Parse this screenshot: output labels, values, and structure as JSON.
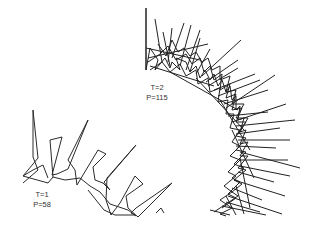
{
  "figure": {
    "panels": [
      {
        "id": "t1",
        "label_line1": "T=1",
        "label_line2": "P=58",
        "description": "sparse polyline arc with outward spikes"
      },
      {
        "id": "t2",
        "label_line1": "T=2",
        "label_line2": "P=115",
        "description": "dense polyline arc with many outward spikes"
      }
    ],
    "stroke_color": "#222222",
    "background_color": "#ffffff"
  }
}
